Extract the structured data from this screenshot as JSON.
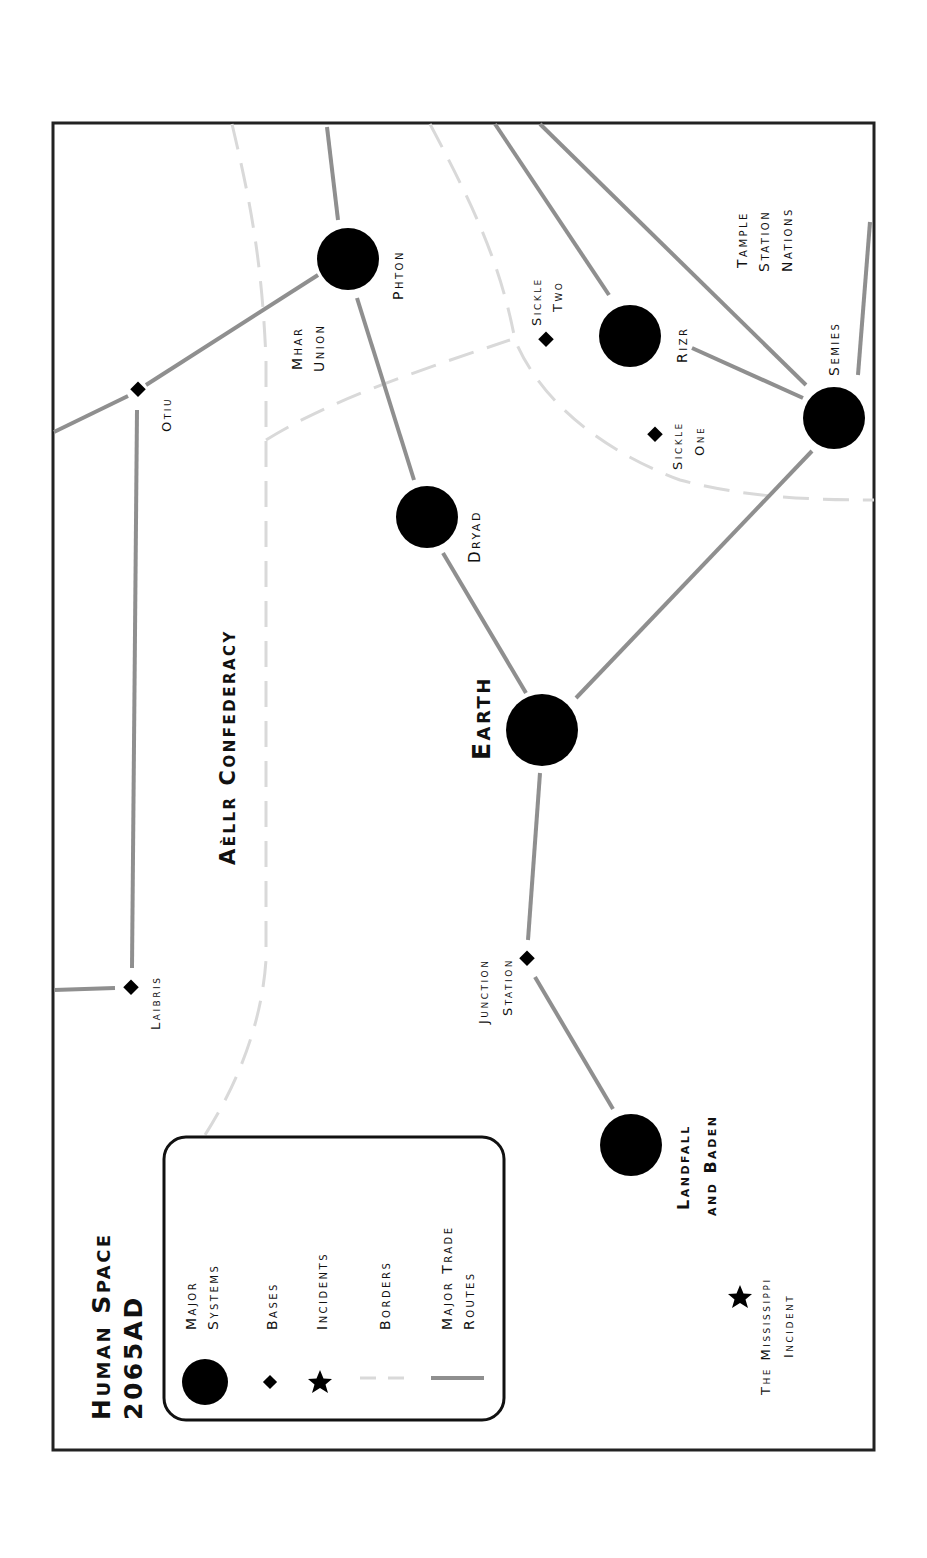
{
  "map": {
    "title_line1": "Human Space",
    "title_line2": "2065AD",
    "orientation": "rotated 90° counter-clockwise",
    "frame": {
      "x": 52,
      "y": 122,
      "width": 823,
      "height": 1329
    },
    "colors": {
      "system": "#000000",
      "route": "#8f8f8f",
      "border": "#d9d9d9",
      "frame": "#222222"
    }
  },
  "legend": {
    "items": [
      {
        "symbol": "major-system",
        "label_line1": "Major",
        "label_line2": "Systems"
      },
      {
        "symbol": "base",
        "label_line1": "Bases",
        "label_line2": ""
      },
      {
        "symbol": "incident",
        "label_line1": "Incidents",
        "label_line2": ""
      },
      {
        "symbol": "border",
        "label_line1": "Borders",
        "label_line2": ""
      },
      {
        "symbol": "trade-route",
        "label_line1": "Major Trade",
        "label_line2": "Routes"
      }
    ]
  },
  "regions": {
    "aellr": "Aèllr Confederacy",
    "mhar_line1": "Mhar",
    "mhar_line2": "Union",
    "tample_line1": "Tample",
    "tample_line2": "Station",
    "tample_line3": "Nations"
  },
  "systems": {
    "phton": "Phton",
    "rizr": "Rizr",
    "semies": "Semies",
    "dryad": "Dryad",
    "earth": "Earth",
    "landfall_line1": "Landfall",
    "landfall_line2": "and Baden"
  },
  "bases": {
    "otiu": "Otiu",
    "sickle_two_line1": "Sickle",
    "sickle_two_line2": "Two",
    "sickle_one_line1": "Sickle",
    "sickle_one_line2": "One",
    "laibris": "Laibris",
    "junction_line1": "Junction",
    "junction_line2": "Station"
  },
  "incidents": {
    "mississippi_line1": "The Mississippi",
    "mississippi_line2": "Incident"
  }
}
